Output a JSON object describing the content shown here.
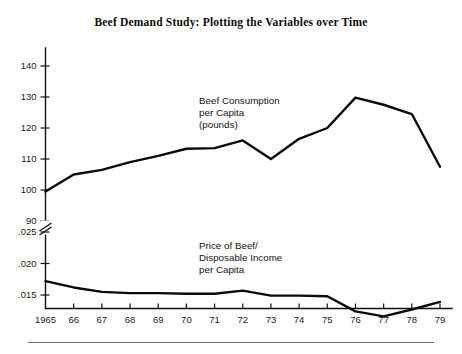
{
  "figure": {
    "title": "Beef Demand Study: Plotting the Variables over Time",
    "background_color": "#ffffff",
    "line_color": "#0a0a0a",
    "axis_color": "#111111"
  },
  "chart_data": {
    "type": "line",
    "title": "Beef Demand Study: Plotting the Variables over Time",
    "xlabel": "",
    "ylabel": "",
    "grid": false,
    "legend_position": "inline-annotation",
    "axis_break": {
      "present": true,
      "between": [
        90,
        0.025
      ],
      "symbol": "double-slash"
    },
    "x": [
      1965,
      1966,
      1967,
      1968,
      1969,
      1970,
      1971,
      1972,
      1973,
      1974,
      1975,
      1976,
      1977,
      1978,
      1979
    ],
    "xtick_labels": [
      "1965",
      "66",
      "67",
      "68",
      "69",
      "70",
      "71",
      "72",
      "73",
      "74",
      "75",
      "76",
      "77",
      "78",
      "79"
    ],
    "axes": [
      {
        "name": "upper",
        "ytick_labels": [
          "100",
          "110",
          "120",
          "130",
          "140"
        ],
        "ytick_values": [
          100,
          110,
          120,
          130,
          140
        ],
        "ylim": [
          95,
          145
        ]
      },
      {
        "name": "lower",
        "ytick_labels": [
          ".025",
          ".020",
          ".015"
        ],
        "ytick_values": [
          0.025,
          0.02,
          0.015
        ],
        "ylim": [
          0.0105,
          0.0275
        ],
        "extra_tick_label": "90",
        "extra_tick_value": 90
      }
    ],
    "series": [
      {
        "name": "Beef Consumption per Capita (pounds)",
        "axis": "upper",
        "label_lines": [
          "Beef Consumption",
          "per Capita",
          "(pounds)"
        ],
        "values": [
          99.5,
          105.0,
          106.5,
          109.0,
          111.0,
          113.3,
          113.5,
          116.0,
          110.0,
          116.5,
          120.0,
          129.8,
          127.5,
          124.5,
          107.5
        ]
      },
      {
        "name": "Price of Beef/Disposable Income per Capita",
        "axis": "lower",
        "label_lines": [
          "Price of Beef/",
          "Disposable Income",
          "per Capita"
        ],
        "values": [
          0.0172,
          0.0162,
          0.0155,
          0.0153,
          0.0153,
          0.0152,
          0.0152,
          0.0157,
          0.0149,
          0.0149,
          0.0148,
          0.0124,
          0.0116,
          0.0127,
          0.0139
        ]
      }
    ]
  }
}
